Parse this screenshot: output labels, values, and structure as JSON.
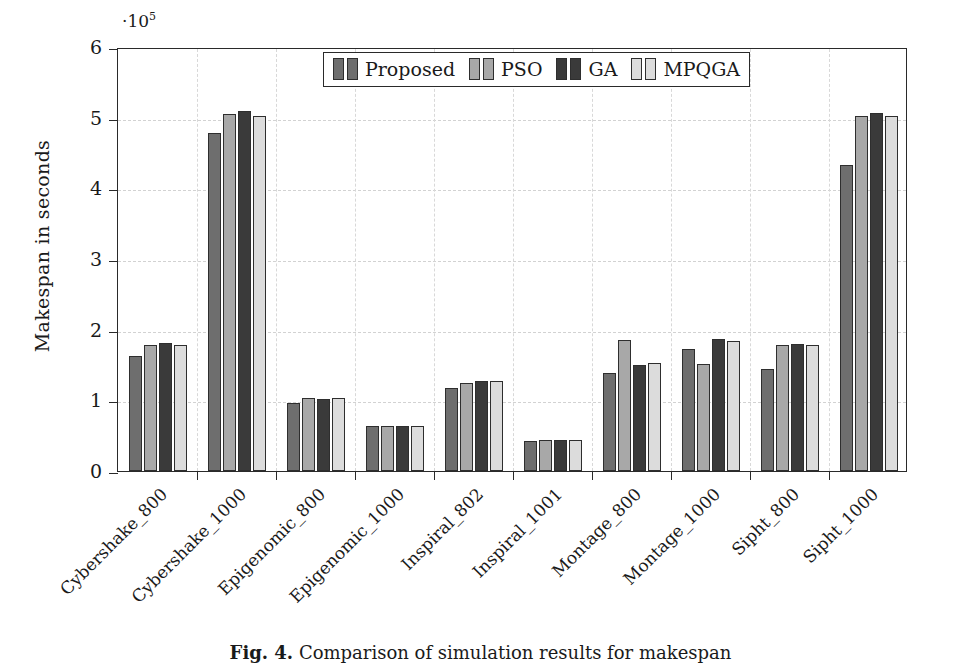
{
  "chart_data": {
    "type": "bar",
    "title": "",
    "xlabel": "",
    "ylabel": "Makespan in seconds",
    "y_multiplier": "·10",
    "y_multiplier_exp": "5",
    "ylim": [
      0,
      6
    ],
    "yticks": [
      0,
      1,
      2,
      3,
      4,
      5,
      6
    ],
    "ytick_labels": [
      "0",
      "1",
      "2",
      "3",
      "4",
      "5",
      "6"
    ],
    "grid": true,
    "legend_position": "top-center",
    "categories": [
      "Cybershake_800",
      "Cybershake_1000",
      "Epigenomic_800",
      "Epigenomic_1000",
      "Inspiral_802",
      "Inspiral_1001",
      "Montage_800",
      "Montage_1000",
      "Sipht_800",
      "Sipht_1000"
    ],
    "series": [
      {
        "name": "Proposed",
        "color": "#6e6e6e",
        "values": [
          1.63,
          4.79,
          0.96,
          0.63,
          1.18,
          0.42,
          1.39,
          1.72,
          1.45,
          4.33
        ]
      },
      {
        "name": "PSO",
        "color": "#a8a8a8",
        "values": [
          1.79,
          5.05,
          1.03,
          0.64,
          1.25,
          0.44,
          1.85,
          1.52,
          1.78,
          5.03
        ]
      },
      {
        "name": "GA",
        "color": "#3a3a3a",
        "values": [
          1.81,
          5.09,
          1.02,
          0.64,
          1.28,
          0.44,
          1.5,
          1.87,
          1.8,
          5.07
        ]
      },
      {
        "name": "MPQGA",
        "color": "#dcdcdc",
        "values": [
          1.78,
          5.03,
          1.04,
          0.64,
          1.27,
          0.44,
          1.53,
          1.84,
          1.78,
          5.02
        ]
      }
    ]
  },
  "caption": {
    "figure_number": "Fig. 4.",
    "text": "Comparison of simulation results for makespan"
  }
}
